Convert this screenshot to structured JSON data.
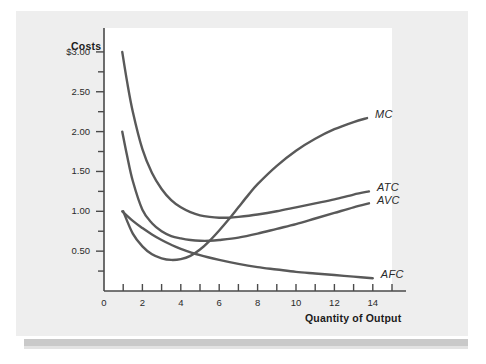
{
  "chart_data": {
    "type": "line",
    "title": "",
    "xlabel": "Quantity of Output",
    "ylabel": "Costs",
    "xlim": [
      0,
      15
    ],
    "ylim": [
      0,
      3.3
    ],
    "grid": false,
    "legend_position": "right-of-curve-ends",
    "x_ticks": [
      0,
      1,
      2,
      3,
      4,
      5,
      6,
      7,
      8,
      9,
      10,
      11,
      12,
      13,
      14,
      15
    ],
    "x_tick_labels": [
      "0",
      "2",
      "4",
      "6",
      "8",
      "10",
      "12",
      "14"
    ],
    "x_tick_label_values": [
      0,
      2,
      4,
      6,
      8,
      10,
      12,
      14
    ],
    "y_tick_labels": [
      "$3.00",
      "2.50",
      "2.00",
      "1.50",
      "1.00",
      "0.50"
    ],
    "y_tick_label_values": [
      3.0,
      2.5,
      2.0,
      1.5,
      1.0,
      0.5
    ],
    "y_minor_ticks": [
      0.25,
      0.75,
      1.25,
      1.75,
      2.25,
      2.75
    ],
    "series": [
      {
        "name": "MC",
        "label": "MC",
        "color": "#595959",
        "x": [
          1.0,
          1.5,
          2.0,
          2.5,
          3.0,
          3.5,
          4.0,
          4.5,
          5.0,
          5.5,
          6.0,
          6.5,
          7.0,
          7.5,
          8.0,
          9.0,
          10.0,
          11.0,
          12.0,
          13.0,
          13.7
        ],
        "y": [
          1.0,
          0.72,
          0.56,
          0.46,
          0.41,
          0.39,
          0.4,
          0.44,
          0.52,
          0.63,
          0.76,
          0.9,
          1.05,
          1.2,
          1.34,
          1.57,
          1.76,
          1.91,
          2.03,
          2.12,
          2.17
        ]
      },
      {
        "name": "ATC",
        "label": "ATC",
        "color": "#595959",
        "x": [
          0.95,
          1.2,
          1.5,
          2.0,
          2.5,
          3.0,
          3.5,
          4.0,
          4.5,
          5.0,
          5.5,
          6.0,
          6.5,
          7.0,
          8.0,
          9.0,
          10.0,
          11.0,
          12.0,
          13.0,
          13.8
        ],
        "y": [
          3.0,
          2.63,
          2.25,
          1.78,
          1.48,
          1.28,
          1.14,
          1.05,
          0.99,
          0.95,
          0.93,
          0.92,
          0.92,
          0.93,
          0.96,
          1.0,
          1.05,
          1.1,
          1.15,
          1.21,
          1.25
        ]
      },
      {
        "name": "AVC",
        "label": "AVC",
        "color": "#595959",
        "x": [
          0.95,
          1.2,
          1.5,
          2.0,
          2.5,
          3.0,
          3.5,
          4.0,
          4.5,
          5.0,
          5.5,
          6.0,
          7.0,
          8.0,
          9.0,
          10.0,
          11.0,
          12.0,
          13.0,
          13.8
        ],
        "y": [
          2.0,
          1.7,
          1.38,
          1.02,
          0.85,
          0.75,
          0.69,
          0.66,
          0.64,
          0.63,
          0.63,
          0.64,
          0.67,
          0.72,
          0.78,
          0.84,
          0.91,
          0.98,
          1.05,
          1.1
        ]
      },
      {
        "name": "AFC",
        "label": "AFC",
        "color": "#595959",
        "x": [
          0.95,
          1.5,
          2.0,
          2.5,
          3.0,
          3.5,
          4.0,
          5.0,
          6.0,
          7.0,
          8.0,
          9.0,
          10.0,
          11.0,
          12.0,
          13.0,
          14.0
        ],
        "y": [
          1.0,
          0.88,
          0.79,
          0.71,
          0.64,
          0.58,
          0.53,
          0.45,
          0.39,
          0.34,
          0.3,
          0.27,
          0.24,
          0.22,
          0.2,
          0.18,
          0.16
        ]
      }
    ]
  },
  "axes": {
    "y_title": "Costs",
    "x_title": "Quantity of Output"
  },
  "y_ticks": [
    {
      "label": "$3.00",
      "value": 3.0
    },
    {
      "label": "2.50",
      "value": 2.5
    },
    {
      "label": "2.00",
      "value": 2.0
    },
    {
      "label": "1.50",
      "value": 1.5
    },
    {
      "label": "1.00",
      "value": 1.0
    },
    {
      "label": "0.50",
      "value": 0.5
    }
  ],
  "x_ticks": [
    {
      "label": "0",
      "value": 0
    },
    {
      "label": "2",
      "value": 2
    },
    {
      "label": "4",
      "value": 4
    },
    {
      "label": "6",
      "value": 6
    },
    {
      "label": "8",
      "value": 8
    },
    {
      "label": "10",
      "value": 10
    },
    {
      "label": "12",
      "value": 12
    },
    {
      "label": "14",
      "value": 14
    }
  ],
  "curve_labels": [
    {
      "name": "MC",
      "label": "MC"
    },
    {
      "name": "ATC",
      "label": "ATC"
    },
    {
      "name": "AVC",
      "label": "AVC"
    },
    {
      "name": "AFC",
      "label": "AFC"
    }
  ],
  "colors": {
    "curve": "#595959",
    "axis": "#4a4a4a",
    "panel": "#eeeeee",
    "plot": "#ffffff",
    "text": "#1b1b1b"
  }
}
